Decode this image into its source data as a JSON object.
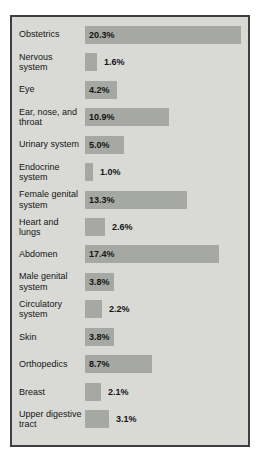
{
  "chart_data": {
    "type": "bar",
    "orientation": "horizontal",
    "title": "",
    "xlabel": "",
    "ylabel": "",
    "unit": "%",
    "xlim": [
      0,
      21
    ],
    "grid": false,
    "legend": "none",
    "categories": [
      "Obstetrics",
      "Nervous system",
      "Eye",
      "Ear, nose, and throat",
      "Urinary system",
      "Endocrine system",
      "Female genital system",
      "Heart and lungs",
      "Abdomen",
      "Male genital system",
      "Circulatory system",
      "Skin",
      "Orthopedics",
      "Breast",
      "Upper digestive tract"
    ],
    "values": [
      20.3,
      1.6,
      4.2,
      10.9,
      5.0,
      1.0,
      13.3,
      2.6,
      17.4,
      3.8,
      2.2,
      3.8,
      8.7,
      2.1,
      3.1
    ],
    "value_labels": [
      "20.3%",
      "1.6%",
      "4.2%",
      "10.9%",
      "5.0%",
      "1.0%",
      "13.3%",
      "2.6%",
      "17.4%",
      "3.8%",
      "2.2%",
      "3.8%",
      "8.7%",
      "2.1%",
      "3.1%"
    ]
  },
  "colors": {
    "page_background": "#ffffff",
    "panel_background": "#d9dad6",
    "bar_fill": "#a6a9a3",
    "border": "#3f3f3f",
    "text": "#141414"
  }
}
